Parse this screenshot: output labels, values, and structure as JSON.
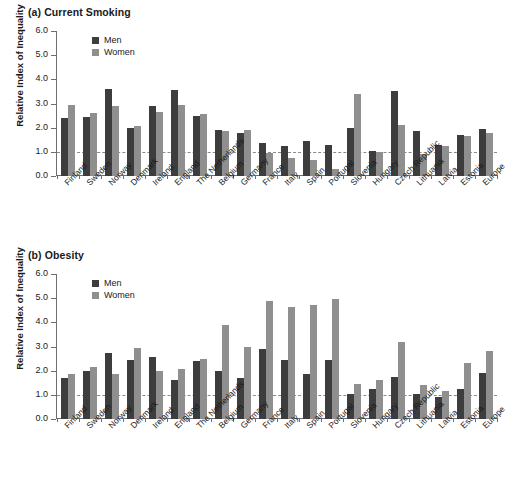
{
  "figure": {
    "y_axis_title": "Relative Index of Inequality",
    "y_ticks": [
      "0.0",
      "1.0",
      "2.0",
      "3.0",
      "4.0",
      "5.0",
      "6.0"
    ],
    "reference_value": 1.0,
    "colors": {
      "men": "#3d3d3d",
      "women": "#8f8f8f",
      "axis": "#6e6e6e",
      "refline": "#8a8a8a"
    },
    "legend": {
      "men_label": "Men",
      "women_label": "Women"
    },
    "countries": [
      "Finland",
      "Sweden",
      "Norway",
      "Denmark",
      "Ireland",
      "England",
      "The Netherlands",
      "Belgium",
      "Germany",
      "France",
      "Italy",
      "Spain",
      "Portugal",
      "Slovenia",
      "Hungary",
      "Czech Republic",
      "Lithuania",
      "Latvia",
      "Estonia",
      "Europe"
    ]
  },
  "panel_a": {
    "title": "(a) Current Smoking"
  },
  "panel_b": {
    "title": "(b) Obesity"
  },
  "chart_data": [
    {
      "type": "bar",
      "title": "(a) Current Smoking",
      "xlabel": "",
      "ylabel": "Relative Index of Inequality",
      "ylim": [
        0.0,
        6.0
      ],
      "yticks": [
        0.0,
        1.0,
        2.0,
        3.0,
        4.0,
        5.0,
        6.0
      ],
      "grid": false,
      "legend_position": "top-left",
      "reference_line": 1.0,
      "categories": [
        "Finland",
        "Sweden",
        "Norway",
        "Denmark",
        "Ireland",
        "England",
        "The Netherlands",
        "Belgium",
        "Germany",
        "France",
        "Italy",
        "Spain",
        "Portugal",
        "Slovenia",
        "Hungary",
        "Czech Republic",
        "Lithuania",
        "Latvia",
        "Estonia",
        "Europe"
      ],
      "series": [
        {
          "name": "Men",
          "values": [
            2.4,
            2.45,
            3.6,
            2.0,
            2.9,
            3.55,
            2.5,
            1.9,
            1.8,
            1.35,
            1.25,
            1.45,
            1.3,
            2.0,
            1.05,
            3.5,
            1.85,
            1.3,
            1.7,
            1.95
          ]
        },
        {
          "name": "Women",
          "values": [
            2.95,
            2.6,
            2.9,
            2.05,
            2.65,
            2.95,
            2.55,
            1.85,
            1.9,
            0.95,
            0.75,
            0.65,
            0.3,
            3.4,
            1.0,
            2.1,
            0.9,
            1.25,
            1.65,
            1.8
          ]
        }
      ]
    },
    {
      "type": "bar",
      "title": "(b) Obesity",
      "xlabel": "",
      "ylabel": "Relative Index of Inequality",
      "ylim": [
        0.0,
        6.0
      ],
      "yticks": [
        0.0,
        1.0,
        2.0,
        3.0,
        4.0,
        5.0,
        6.0
      ],
      "grid": false,
      "legend_position": "top-left",
      "reference_line": 1.0,
      "categories": [
        "Finland",
        "Sweden",
        "Norway",
        "Denmark",
        "Ireland",
        "England",
        "The Netherlands",
        "Belgium",
        "Germany",
        "France",
        "Italy",
        "Spain",
        "Portugal",
        "Slovenia",
        "Hungary",
        "Czech Republic",
        "Lithuania",
        "Latvia",
        "Estonia",
        "Europe"
      ],
      "series": [
        {
          "name": "Men",
          "values": [
            1.7,
            2.0,
            2.75,
            2.45,
            2.55,
            1.6,
            2.4,
            2.0,
            1.7,
            2.9,
            2.45,
            1.85,
            2.45,
            1.05,
            1.25,
            1.75,
            1.05,
            0.9,
            1.25,
            1.9
          ]
        },
        {
          "name": "Women",
          "values": [
            1.85,
            2.15,
            1.85,
            2.95,
            2.0,
            2.05,
            2.5,
            3.9,
            3.0,
            4.9,
            4.65,
            4.7,
            4.95,
            1.45,
            1.6,
            3.2,
            1.4,
            1.15,
            2.3,
            2.8
          ]
        }
      ]
    }
  ]
}
